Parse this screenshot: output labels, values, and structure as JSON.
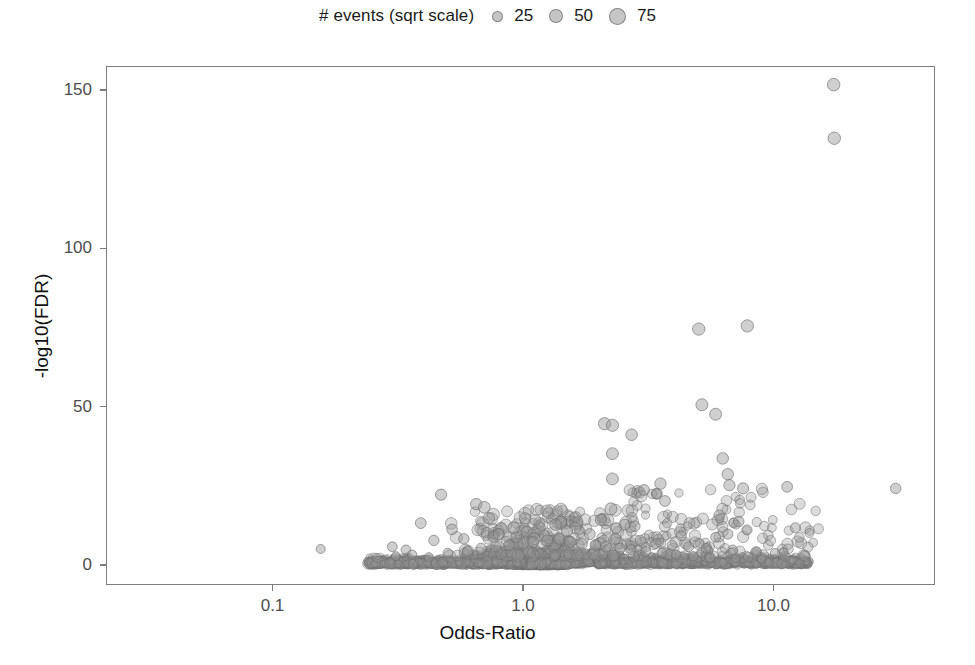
{
  "legend": {
    "title": "# events (sqrt scale)",
    "icon": "circle-marker-icon",
    "entries": [
      {
        "label": "25",
        "size_px": 11
      },
      {
        "label": "50",
        "size_px": 14
      },
      {
        "label": "75",
        "size_px": 17
      }
    ]
  },
  "colors": {
    "marker_fill": "#969696",
    "marker_stroke": "#6e6e6e",
    "panel_border": "#7d7d7d",
    "axis_text": "#4d4d4d",
    "label_text": "#111111",
    "background": "#ffffff"
  },
  "chart_data": {
    "type": "scatter",
    "title": "",
    "subtitle": "",
    "xlabel": "Odds-Ratio",
    "ylabel": "-log10(FDR)",
    "xscale": "log10",
    "yscale": "linear",
    "xticks": [
      0.1,
      1.0,
      10.0
    ],
    "xtick_labels": [
      "0.1",
      "1.0",
      "10.0"
    ],
    "yticks": [
      0,
      50,
      100,
      150
    ],
    "ytick_labels": [
      "0",
      "50",
      "100",
      "150"
    ],
    "xlim": [
      0.032,
      50.0
    ],
    "ylim": [
      -8,
      158
    ],
    "grid": false,
    "legend_position": "top",
    "size_legend_title": "# events (sqrt scale)",
    "size_legend_values": [
      25,
      50,
      75
    ],
    "marker_opacity": 0.45,
    "size_encoding": "sqrt(# events)",
    "series": [
      {
        "name": "associations",
        "comment": "points as [odds_ratio, -log10(FDR), n_events]",
        "points": [
          [
            17.5,
            152.0,
            62
          ],
          [
            17.6,
            135.0,
            60
          ],
          [
            5.05,
            74.5,
            58
          ],
          [
            7.9,
            75.5,
            58
          ],
          [
            5.2,
            50.5,
            52
          ],
          [
            5.9,
            47.5,
            50
          ],
          [
            2.12,
            44.5,
            56
          ],
          [
            2.28,
            44.0,
            56
          ],
          [
            2.72,
            41.0,
            46
          ],
          [
            2.28,
            35.0,
            50
          ],
          [
            6.3,
            33.5,
            44
          ],
          [
            6.6,
            28.5,
            42
          ],
          [
            2.28,
            27.0,
            50
          ],
          [
            3.55,
            25.5,
            42
          ],
          [
            6.7,
            25.0,
            40
          ],
          [
            3.05,
            23.5,
            34
          ],
          [
            7.6,
            24.0,
            38
          ],
          [
            11.4,
            24.5,
            34
          ],
          [
            31.0,
            24.0,
            30
          ],
          [
            3.7,
            20.0,
            34
          ],
          [
            0.65,
            19.0,
            44
          ],
          [
            0.7,
            18.0,
            48
          ],
          [
            2.25,
            17.5,
            52
          ],
          [
            0.47,
            22.0,
            40
          ],
          [
            0.73,
            14.5,
            44
          ],
          [
            1.02,
            14.5,
            40
          ],
          [
            1.12,
            14.0,
            38
          ],
          [
            2.05,
            14.0,
            38
          ],
          [
            6.1,
            15.5,
            30
          ],
          [
            7.3,
            13.5,
            30
          ],
          [
            2.55,
            12.5,
            34
          ],
          [
            2.8,
            12.0,
            32
          ],
          [
            0.39,
            13.0,
            34
          ],
          [
            0.52,
            11.0,
            32
          ],
          [
            1.35,
            12.5,
            44
          ],
          [
            1.62,
            11.5,
            40
          ],
          [
            12.3,
            11.5,
            26
          ],
          [
            6.6,
            9.5,
            26
          ],
          [
            4.3,
            9.0,
            26
          ],
          [
            5.9,
            8.5,
            24
          ],
          [
            0.155,
            4.8,
            16
          ],
          [
            0.3,
            5.5,
            22
          ],
          [
            0.34,
            4.5,
            22
          ],
          [
            0.44,
            7.5,
            28
          ],
          [
            0.58,
            8.0,
            30
          ],
          [
            0.8,
            9.5,
            36
          ],
          [
            0.94,
            8.5,
            34
          ],
          [
            1.22,
            9.0,
            36
          ],
          [
            1.5,
            10.5,
            38
          ],
          [
            1.85,
            9.5,
            36
          ],
          [
            2.35,
            8.0,
            30
          ],
          [
            2.95,
            7.5,
            28
          ],
          [
            3.4,
            6.5,
            26
          ],
          [
            3.95,
            6.0,
            24
          ],
          [
            4.6,
            5.5,
            24
          ],
          [
            5.4,
            5.0,
            22
          ],
          [
            6.9,
            4.5,
            22
          ],
          [
            8.6,
            4.0,
            20
          ],
          [
            10.2,
            3.5,
            18
          ],
          [
            0.26,
            2.0,
            14
          ],
          [
            0.31,
            2.5,
            16
          ],
          [
            0.36,
            3.0,
            18
          ],
          [
            0.42,
            2.2,
            16
          ],
          [
            0.5,
            3.5,
            20
          ],
          [
            0.6,
            4.0,
            24
          ],
          [
            0.68,
            5.0,
            28
          ],
          [
            0.78,
            5.5,
            30
          ],
          [
            0.88,
            6.0,
            32
          ],
          [
            1.0,
            6.5,
            34
          ],
          [
            1.1,
            7.0,
            36
          ],
          [
            1.25,
            7.5,
            38
          ],
          [
            1.4,
            8.0,
            40
          ],
          [
            1.55,
            7.0,
            38
          ],
          [
            1.72,
            6.5,
            36
          ],
          [
            1.95,
            6.0,
            34
          ],
          [
            2.15,
            5.5,
            32
          ],
          [
            2.45,
            5.0,
            28
          ],
          [
            2.7,
            4.5,
            26
          ],
          [
            3.1,
            4.0,
            24
          ],
          [
            3.6,
            3.5,
            22
          ],
          [
            4.1,
            3.0,
            20
          ],
          [
            4.8,
            2.5,
            18
          ],
          [
            5.6,
            2.0,
            16
          ],
          [
            7.1,
            1.8,
            14
          ],
          [
            9.0,
            1.5,
            12
          ],
          [
            12.0,
            1.2,
            10
          ]
        ]
      }
    ]
  }
}
